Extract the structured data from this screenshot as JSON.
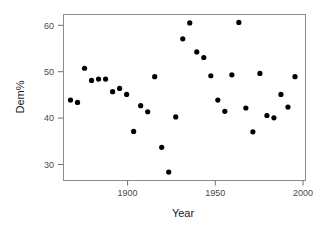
{
  "chart_data": {
    "type": "scatter",
    "title": "",
    "xlabel": "Year",
    "ylabel": "Dem%",
    "xlim": [
      1864,
      2002
    ],
    "ylim": [
      27.0,
      62.5
    ],
    "xticks": [
      1900,
      1950,
      2000
    ],
    "xtick_labels": [
      "1900",
      "1950",
      "2000"
    ],
    "yticks": [
      30,
      40,
      50,
      60
    ],
    "ytick_labels": [
      "30",
      "40",
      "50",
      "60"
    ],
    "grid": false,
    "legend": null,
    "marker": "filled-circle",
    "marker_color": "#000000",
    "x": [
      1868,
      1872,
      1876,
      1880,
      1884,
      1888,
      1892,
      1896,
      1900,
      1904,
      1908,
      1912,
      1916,
      1920,
      1924,
      1928,
      1932,
      1936,
      1940,
      1944,
      1948,
      1952,
      1956,
      1960,
      1964,
      1968,
      1972,
      1976,
      1980,
      1984,
      1988,
      1992,
      1996
    ],
    "y": [
      44.2,
      43.7,
      51.0,
      48.4,
      48.7,
      48.7,
      46.0,
      46.7,
      45.4,
      37.5,
      43.0,
      41.7,
      49.2,
      34.1,
      28.8,
      40.6,
      57.3,
      60.7,
      54.5,
      53.3,
      49.4,
      44.2,
      41.8,
      49.6,
      60.8,
      42.5,
      37.4,
      49.9,
      40.9,
      40.4,
      45.4,
      42.7,
      49.2
    ],
    "series_name": "Democratic share of popular vote"
  },
  "axis": {
    "y_label": "Dem%",
    "x_label": "Year"
  }
}
